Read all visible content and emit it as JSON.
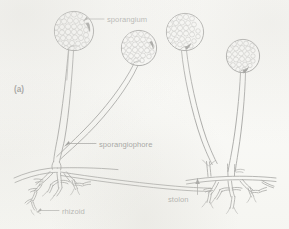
{
  "figure": {
    "panel_label": "(a)",
    "background_color": "#fbfbf9",
    "ink_color": "#222222"
  },
  "labels": {
    "sporangium": "sporangium",
    "sporangiophore": "sporangiophore",
    "rhizoid": "rhizoid",
    "stolon": "stolon"
  },
  "label_positions": {
    "sporangium": {
      "x": 107,
      "y": 22
    },
    "sporangiophore": {
      "x": 99,
      "y": 146
    },
    "rhizoid": {
      "x": 62,
      "y": 213
    },
    "stolon": {
      "x": 168,
      "y": 199
    },
    "panel": {
      "x": 14,
      "y": 92
    }
  },
  "structures": {
    "sporangia": [
      {
        "name": "sporangium-1",
        "cx": 74,
        "cy": 31,
        "r": 20
      },
      {
        "name": "sporangium-2",
        "cx": 139,
        "cy": 48,
        "r": 18
      },
      {
        "name": "sporangium-3",
        "cx": 185,
        "cy": 32,
        "r": 19
      },
      {
        "name": "sporangium-4",
        "cx": 243,
        "cy": 56,
        "r": 17
      }
    ],
    "sporangiophore_count": 4,
    "rhizoid_clusters": 2,
    "stolon_count": 1
  }
}
